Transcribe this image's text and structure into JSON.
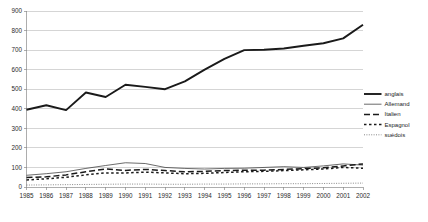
{
  "chart_data": {
    "type": "line",
    "title": "",
    "subtitle": "",
    "xlabel": "",
    "ylabel": "",
    "xlim": [
      1985,
      2002
    ],
    "ylim": [
      0,
      900
    ],
    "grid": "horizontal",
    "legend_position": "right",
    "y_ticks": [
      0,
      100,
      200,
      300,
      400,
      500,
      600,
      700,
      800,
      900
    ],
    "y_tick_labels": [
      "0",
      "100",
      "200",
      "300",
      "400",
      "500",
      "600",
      "700",
      "800",
      "900"
    ],
    "categories": [
      1985,
      1986,
      1987,
      1988,
      1989,
      1990,
      1991,
      1992,
      1993,
      1994,
      1995,
      1996,
      1997,
      1998,
      1999,
      2000,
      2001,
      2002
    ],
    "x_tick_labels": [
      "1985",
      "1986",
      "1987",
      "1988",
      "1989",
      "1990",
      "1991",
      "1992",
      "1993",
      "1994",
      "1995",
      "1996",
      "1997",
      "1998",
      "1999",
      "2000",
      "2001",
      "2002"
    ],
    "series": [
      {
        "name": "anglais",
        "style": "solid-thick",
        "color": "#1a1a1a",
        "width": 1.9,
        "dash": "",
        "values": [
          395,
          418,
          393,
          483,
          460,
          523,
          512,
          500,
          540,
          600,
          655,
          700,
          702,
          708,
          722,
          735,
          760,
          830
        ]
      },
      {
        "name": "Allemand",
        "style": "solid-thin",
        "color": "#3a3a3a",
        "width": 0.75,
        "dash": "",
        "values": [
          60,
          68,
          78,
          95,
          110,
          124,
          120,
          100,
          95,
          92,
          95,
          96,
          100,
          104,
          100,
          108,
          118,
          112
        ]
      },
      {
        "name": "Italien",
        "style": "dashed",
        "color": "#1a1a1a",
        "width": 1.5,
        "dash": "6 3",
        "values": [
          48,
          52,
          62,
          78,
          92,
          85,
          90,
          84,
          78,
          80,
          84,
          86,
          86,
          90,
          94,
          98,
          108,
          118
        ]
      },
      {
        "name": "Espagnol",
        "style": "dash-dot",
        "color": "#1a1a1a",
        "width": 1.5,
        "dash": "2.5 2.5",
        "values": [
          36,
          42,
          50,
          62,
          72,
          72,
          76,
          72,
          68,
          70,
          74,
          78,
          80,
          84,
          88,
          92,
          100,
          96
        ]
      },
      {
        "name": "suédois",
        "style": "dotted",
        "color": "#555555",
        "width": 0.7,
        "dash": "1 1.4",
        "values": [
          10,
          11,
          12,
          13,
          14,
          15,
          15,
          14,
          14,
          15,
          15,
          16,
          16,
          17,
          17,
          18,
          19,
          20
        ]
      }
    ],
    "legend_entries": [
      {
        "label": "anglais"
      },
      {
        "label": "Allemand"
      },
      {
        "label": "Italien"
      },
      {
        "label": "Espagnol"
      },
      {
        "label": "suédois"
      }
    ]
  }
}
